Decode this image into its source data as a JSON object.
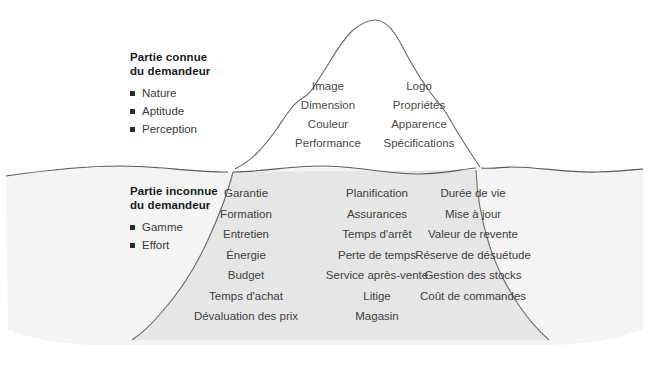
{
  "diagram": {
    "type": "iceberg",
    "colors": {
      "water_fill": "#f4f4f4",
      "iceberg_submerged_fill": "#e6e6e6",
      "iceberg_visible_fill": "#ffffff",
      "outline": "#555555",
      "text": "#444444",
      "heading_text": "#1a1a1a",
      "bullet": "#2b2b2b"
    },
    "above_water": {
      "legend": {
        "title_line_1": "Partie connue",
        "title_line_2": "du demandeur",
        "items": [
          {
            "label": "Nature"
          },
          {
            "label": "Aptitude"
          },
          {
            "label": "Perception"
          }
        ]
      },
      "columns": [
        {
          "name": "visible-left",
          "entries": [
            "Image",
            "Dimension",
            "Couleur",
            "Performance"
          ]
        },
        {
          "name": "visible-right",
          "entries": [
            "Logo",
            "Propriétés",
            "Apparence",
            "Spécifications"
          ]
        }
      ]
    },
    "below_water": {
      "legend": {
        "title_line_1": "Partie inconnue",
        "title_line_2": "du demandeur",
        "items": [
          {
            "label": "Gamme"
          },
          {
            "label": "Effort"
          }
        ]
      },
      "columns": [
        {
          "name": "hidden-1",
          "entries": [
            "Garantie",
            "Formation",
            "Entretien",
            "Énergie",
            "Budget",
            "Temps d'achat",
            "Dévaluation des prix"
          ]
        },
        {
          "name": "hidden-2",
          "entries": [
            "Planification",
            "Assurances",
            "Temps d'arrêt",
            "Perte de temps",
            "Service après-vente",
            "Litige",
            "Magasin"
          ]
        },
        {
          "name": "hidden-3",
          "entries": [
            "Durée de vie",
            "Mise à jour",
            "Valeur de revente",
            "Réserve de désuétude",
            "Gestion des stocks",
            "Coût de commandes"
          ]
        }
      ]
    }
  }
}
